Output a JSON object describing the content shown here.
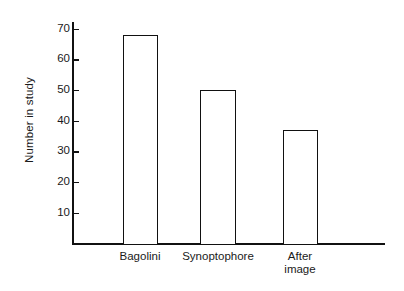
{
  "chart_data": {
    "type": "bar",
    "title": "",
    "subtitle": "",
    "xlabel": "",
    "ylabel": "Number in study",
    "categories": [
      "Bagolini",
      "Synoptophore",
      "After image"
    ],
    "category_lines": [
      [
        "Bagolini"
      ],
      [
        "Synoptophore"
      ],
      [
        "After",
        "image"
      ]
    ],
    "values": [
      68,
      50,
      37
    ],
    "ylim": [
      0,
      75
    ],
    "ytick_values": [
      10,
      20,
      30,
      40,
      50,
      60,
      70
    ],
    "ytick_labels": [
      "10",
      "20",
      "30",
      "40",
      "50",
      "60",
      "70"
    ],
    "grid": false,
    "legend": false,
    "legend_position": "none",
    "bar_fill_color": "#ffffff",
    "bar_edge_color": "#111111",
    "axis_color": "#111111",
    "background_color": "#ffffff"
  },
  "axes": {
    "y_title": "Number in study"
  }
}
